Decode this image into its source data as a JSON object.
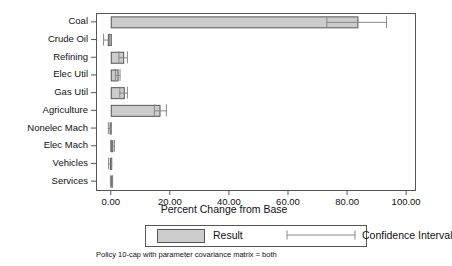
{
  "chart_data": {
    "type": "bar",
    "orientation": "horizontal",
    "title": "",
    "xlabel": "Percent Change from Base",
    "ylabel": "",
    "xlim": [
      -5.0,
      103.0
    ],
    "xticks": [
      0,
      20,
      40,
      60,
      80,
      100
    ],
    "xtick_labels": [
      "0.00",
      "20.00",
      "40.00",
      "60.00",
      "80.00",
      "100.00"
    ],
    "grid": false,
    "legend_position": "below-axis",
    "categories": [
      "Coal",
      "Crude Oil",
      "Refining",
      "Elec Util",
      "Gas Util",
      "Agriculture",
      "Nonelec Mach",
      "Elec Mach",
      "Vehicles",
      "Services"
    ],
    "values": [
      83.5,
      -1.0,
      4.2,
      2.3,
      4.4,
      16.5,
      -0.4,
      0.5,
      -0.3,
      0.2
    ],
    "ci_low": [
      73.0,
      -2.6,
      2.6,
      1.4,
      2.9,
      14.6,
      -1.0,
      -0.2,
      -0.9,
      -0.3
    ],
    "ci_high": [
      93.5,
      -0.2,
      5.8,
      3.3,
      5.8,
      19.0,
      0.4,
      1.4,
      0.5,
      0.8
    ],
    "series": [
      {
        "name": "Result",
        "values": [
          83.5,
          -1.0,
          4.2,
          2.3,
          4.4,
          16.5,
          -0.4,
          0.5,
          -0.3,
          0.2
        ]
      },
      {
        "name": "Confidence Interval",
        "low": [
          73.0,
          -2.6,
          2.6,
          1.4,
          2.9,
          14.6,
          -1.0,
          -0.2,
          -0.9,
          -0.3
        ],
        "high": [
          93.5,
          -0.2,
          5.8,
          3.3,
          5.8,
          19.0,
          0.4,
          1.4,
          0.5,
          0.8
        ]
      }
    ],
    "colors": {
      "bar_fill": "#cccccc",
      "bar_edge": "#555555",
      "ci_line": "#888888",
      "axis": "#555555",
      "text": "#111111"
    }
  },
  "legend": {
    "result_label": "Result",
    "ci_label": "Confidence Interval"
  },
  "caption": "Policy 10-cap with parameter covariance matrix = both"
}
